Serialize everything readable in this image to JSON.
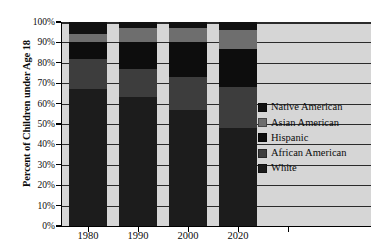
{
  "chart_data": {
    "type": "bar",
    "subtype": "stacked-bar-100-percent",
    "title": "",
    "xlabel": "",
    "ylabel": "Percent of Children under Age 18",
    "categories": [
      "1980",
      "1990",
      "2000",
      "2020"
    ],
    "ylim": [
      0,
      100
    ],
    "ytick_labels": [
      "0%",
      "10%",
      "20%",
      "30%",
      "40%",
      "50%",
      "60%",
      "70%",
      "80%",
      "90%",
      "100%"
    ],
    "ytick_values": [
      0,
      10,
      20,
      30,
      40,
      50,
      60,
      70,
      80,
      90,
      100
    ],
    "grid": true,
    "grid_axis": "y",
    "legend_position": "right-inside",
    "stack_order_bottom_to_top": [
      "White",
      "African American",
      "Hispanic",
      "Asian American",
      "Native American"
    ],
    "series": [
      {
        "name": "White",
        "color": "#1c1c1c",
        "values": [
          67,
          63,
          57,
          48
        ]
      },
      {
        "name": "African American",
        "color": "#3d3d3d",
        "values": [
          15,
          14,
          16,
          20
        ]
      },
      {
        "name": "Hispanic",
        "color": "#0d0d0d",
        "values": [
          8,
          13,
          17,
          19
        ]
      },
      {
        "name": "Asian American",
        "color": "#6e6e6e",
        "values": [
          4,
          7,
          7,
          9
        ]
      },
      {
        "name": "Native American",
        "color": "#111111",
        "values": [
          6,
          3,
          3,
          4
        ]
      }
    ],
    "legend_entries": [
      {
        "label": "Native American",
        "color": "#111111"
      },
      {
        "label": "Asian American",
        "color": "#6e6e6e"
      },
      {
        "label": "Hispanic",
        "color": "#0d0d0d"
      },
      {
        "label": "African American",
        "color": "#3d3d3d"
      },
      {
        "label": "White",
        "color": "#1c1c1c"
      }
    ],
    "plot_background": "#d6d6d6",
    "axis_color": "#000000",
    "gridline_color": "#2b2b2b"
  }
}
